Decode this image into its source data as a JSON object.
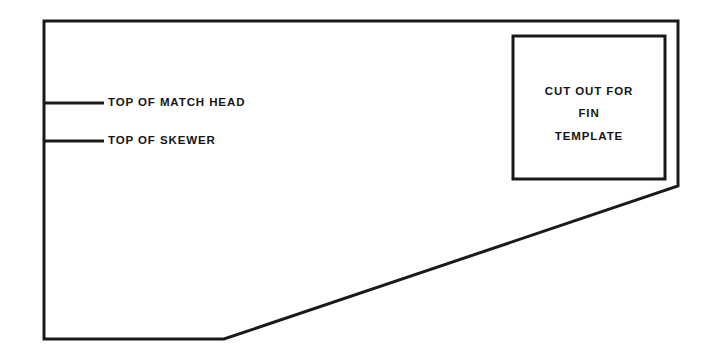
{
  "diagram": {
    "background_color": "#ffffff",
    "line_color": "#1a1a1a",
    "text_color": "#151515",
    "outline": {
      "name": "template-outline",
      "stroke_width": 3,
      "points": "44,21 678,21 678,186 224,339 44,339",
      "description": "rectangle with diagonal cut across lower right"
    },
    "cutout_box": {
      "name": "fin-template-cutout",
      "x": 513,
      "y": 36,
      "width": 152,
      "height": 143,
      "stroke_width": 3,
      "lines": [
        "CUT OUT FOR",
        "FIN",
        "TEMPLATE"
      ]
    },
    "leaders": [
      {
        "name": "leader-top-of-match-head",
        "label": "TOP OF MATCH HEAD",
        "x1": 44,
        "x2": 104,
        "y": 103,
        "stroke_width": 3,
        "text_x": 108
      },
      {
        "name": "leader-top-of-skewer",
        "label": "TOP OF SKEWER",
        "x1": 44,
        "x2": 104,
        "y": 141,
        "stroke_width": 3,
        "text_x": 108
      }
    ]
  }
}
